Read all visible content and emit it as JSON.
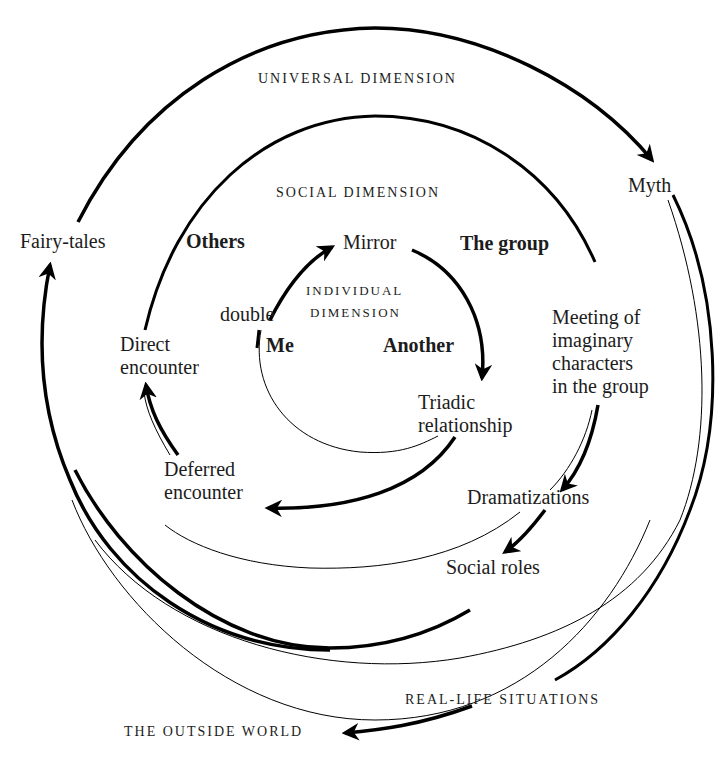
{
  "diagram": {
    "top_fragment": "",
    "dimensions": {
      "universal": "UNIVERSAL DIMENSION",
      "social": "SOCIAL DIMENSION",
      "individual_line1": "INDIVIDUAL",
      "individual_line2": "DIMENSION"
    },
    "nodes": {
      "myth": "Myth",
      "fairy_tales": "Fairy-tales",
      "others": "Others",
      "the_group": "The group",
      "mirror": "Mirror",
      "double": "double",
      "me": "Me",
      "another": "Another",
      "direct_encounter": "Direct\nencounter",
      "meeting": "Meeting of\nimaginary\ncharacters\nin the group",
      "triadic": "Triadic\nrelationship",
      "deferred_encounter": "Deferred\nencounter",
      "dramatizations": "Dramatizations",
      "social_roles": "Social roles",
      "real_life": "REAL-LIFE SITUATIONS",
      "outside_world": "THE OUTSIDE WORLD"
    },
    "colors": {
      "stroke": "#000000",
      "text": "#1c1c1c",
      "background": "#ffffff"
    }
  }
}
